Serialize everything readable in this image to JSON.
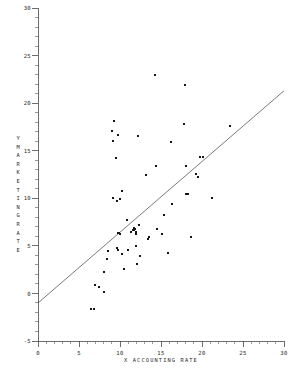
{
  "chart_data": {
    "type": "scatter",
    "title": "",
    "xlabel": "X ACCOUNTING RATE",
    "ylabel": "Y MARKETING RATE",
    "ylabel_chars": [
      "Y",
      "M",
      "A",
      "R",
      "K",
      "E",
      "T",
      "I",
      "N",
      "G",
      "R",
      "A",
      "T",
      "E"
    ],
    "xlim": [
      0,
      30
    ],
    "ylim": [
      -5,
      30
    ],
    "xticks": [
      0,
      5,
      10,
      15,
      20,
      25,
      30
    ],
    "yticks": [
      -5,
      0,
      5,
      10,
      15,
      20,
      25,
      30
    ],
    "xtick_labels": [
      "0",
      "5",
      "10",
      "15",
      "20",
      "25",
      "30"
    ],
    "ytick_labels": [
      "-5",
      "0",
      "5",
      "10",
      "15",
      "20",
      "25",
      "30"
    ],
    "minor_tick_step": 1,
    "grid": false,
    "legend": "none",
    "marker": "square",
    "marker_color": "#151515",
    "line_color": "#4d4d4d",
    "axis_color": "#4a4a4a",
    "fit_line": {
      "type": "linear",
      "x": [
        0,
        30
      ],
      "y": [
        -1.0,
        21.3
      ],
      "slope": 0.743,
      "intercept": -1.0
    },
    "n_points": 62,
    "points": [
      [
        6.5,
        -1.6
      ],
      [
        6.8,
        -1.6
      ],
      [
        7.0,
        0.9
      ],
      [
        7.4,
        0.7
      ],
      [
        8.0,
        0.2
      ],
      [
        8.1,
        2.3
      ],
      [
        8.4,
        3.6
      ],
      [
        8.5,
        4.5
      ],
      [
        9.0,
        17.1
      ],
      [
        9.1,
        16.0
      ],
      [
        9.2,
        10.0
      ],
      [
        9.3,
        18.1
      ],
      [
        9.5,
        14.2
      ],
      [
        9.6,
        4.8
      ],
      [
        9.6,
        9.7
      ],
      [
        9.7,
        4.6
      ],
      [
        9.8,
        16.7
      ],
      [
        9.8,
        6.3
      ],
      [
        10.0,
        6.2
      ],
      [
        10.2,
        4.1
      ],
      [
        10.3,
        10.8
      ],
      [
        10.5,
        2.6
      ],
      [
        10.8,
        7.7
      ],
      [
        11.0,
        4.6
      ],
      [
        11.3,
        6.5
      ],
      [
        11.6,
        6.7
      ],
      [
        11.7,
        6.7
      ],
      [
        11.8,
        6.8
      ],
      [
        11.9,
        6.4
      ],
      [
        11.9,
        5.0
      ],
      [
        12.0,
        6.2
      ],
      [
        12.1,
        3.1
      ],
      [
        12.2,
        16.5
      ],
      [
        12.3,
        7.2
      ],
      [
        12.4,
        3.9
      ],
      [
        13.2,
        12.4
      ],
      [
        13.4,
        5.7
      ],
      [
        13.5,
        5.9
      ],
      [
        14.3,
        23.0
      ],
      [
        14.4,
        13.4
      ],
      [
        14.5,
        6.8
      ],
      [
        15.1,
        6.2
      ],
      [
        15.4,
        8.2
      ],
      [
        15.8,
        4.3
      ],
      [
        16.2,
        15.9
      ],
      [
        16.4,
        9.4
      ],
      [
        17.8,
        17.8
      ],
      [
        17.9,
        21.9
      ],
      [
        18.0,
        13.4
      ],
      [
        18.1,
        10.5
      ],
      [
        18.3,
        10.5
      ],
      [
        18.7,
        5.9
      ],
      [
        19.3,
        12.6
      ],
      [
        19.5,
        12.2
      ],
      [
        19.8,
        14.3
      ],
      [
        20.1,
        14.3
      ],
      [
        21.2,
        10.0
      ],
      [
        23.4,
        17.6
      ],
      [
        10.0,
        9.9
      ],
      [
        11.7,
        6.9
      ],
      [
        12.0,
        6.5
      ],
      [
        9.9,
        6.4
      ]
    ]
  }
}
